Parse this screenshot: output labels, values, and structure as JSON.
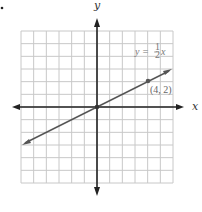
{
  "chart_data": {
    "type": "line",
    "title": "",
    "xlabel": "x",
    "ylabel": "y",
    "xlim": [
      -6,
      6
    ],
    "ylim": [
      -6,
      6
    ],
    "grid": true,
    "series": [
      {
        "name": "y = 1/2 x",
        "equation": "y = (1/2)x",
        "x": [
          -6,
          6
        ],
        "y": [
          -3,
          3
        ]
      }
    ],
    "points": [
      {
        "label": "(4, 2)",
        "x": 4,
        "y": 2
      },
      {
        "label": "origin",
        "x": 0,
        "y": 0
      }
    ],
    "annotations": [
      "y = 1/2 x",
      "(4, 2)"
    ],
    "bullet": "•"
  },
  "labels": {
    "x_axis": "x",
    "y_axis": "y",
    "eq_lhs": "y =",
    "eq_num": "1",
    "eq_den": "2",
    "eq_var": "x",
    "point": "(4, 2)"
  },
  "colors": {
    "grid": "#c8c8c8",
    "axis": "#222222",
    "line": "#555555"
  }
}
